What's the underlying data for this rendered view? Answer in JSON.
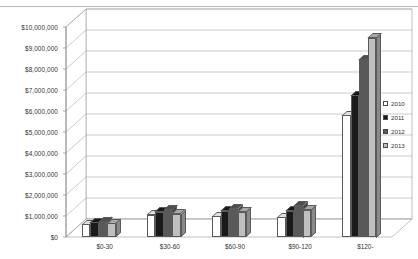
{
  "chart_data": {
    "type": "bar",
    "title": "",
    "xlabel": "",
    "ylabel": "",
    "categories": [
      "$0-30",
      "$30-60",
      "$60-90",
      "$90-120",
      "$120-"
    ],
    "series": [
      {
        "name": "2010",
        "color": "#ffffff",
        "values": [
          600000,
          1050000,
          1000000,
          950000,
          5800000
        ]
      },
      {
        "name": "2011",
        "color": "#1a1a1a",
        "values": [
          700000,
          1200000,
          1250000,
          1250000,
          6750000
        ]
      },
      {
        "name": "2012",
        "color": "#595959",
        "values": [
          750000,
          1300000,
          1350000,
          1500000,
          8450000
        ]
      },
      {
        "name": "2013",
        "color": "#bfbfbf",
        "values": [
          650000,
          1100000,
          1200000,
          1300000,
          9500000
        ]
      }
    ],
    "ylim": [
      0,
      10000000
    ],
    "ytick_values": [
      0,
      1000000,
      2000000,
      3000000,
      4000000,
      5000000,
      6000000,
      7000000,
      8000000,
      9000000,
      10000000
    ],
    "ytick_labels": [
      "$0",
      "$1,000,000",
      "$2,000,000",
      "$3,000,000",
      "$4,000,000",
      "$5,000,000",
      "$6,000,000",
      "$7,000,000",
      "$8,000,000",
      "$9,000,000",
      "$10,000,000"
    ],
    "grid": true,
    "legend_position": "right",
    "style": "3d-clustered-column"
  },
  "legend": {
    "items": [
      {
        "label": "2010",
        "color": "#ffffff"
      },
      {
        "label": "2011",
        "color": "#1a1a1a"
      },
      {
        "label": "2012",
        "color": "#595959"
      },
      {
        "label": "2013",
        "color": "#bfbfbf"
      }
    ]
  }
}
